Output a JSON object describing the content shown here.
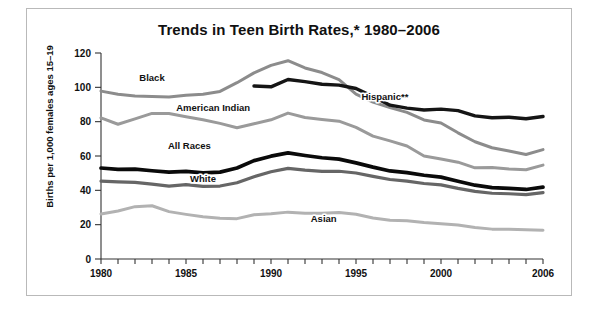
{
  "figure": {
    "title": "Trends in Teen Birth Rates,* 1980–2006",
    "ylabel": "Births per 1,000 females ages 15–19"
  },
  "chart_data": {
    "type": "line",
    "title": "Trends in Teen Birth Rates,* 1980–2006",
    "xlabel": "",
    "ylabel": "Births per 1,000 females ages 15–19",
    "xlim": [
      1980,
      2006
    ],
    "ylim": [
      0,
      120
    ],
    "yticks": [
      0,
      20,
      40,
      60,
      80,
      100,
      120
    ],
    "ytick_labels": [
      "0",
      "20",
      "40",
      "60",
      "80",
      "100",
      "120"
    ],
    "xticks": [
      1980,
      1981,
      1982,
      1983,
      1984,
      1985,
      1986,
      1987,
      1988,
      1989,
      1990,
      1991,
      1992,
      1993,
      1994,
      1995,
      1996,
      1997,
      1998,
      1999,
      2000,
      2001,
      2002,
      2003,
      2004,
      2005,
      2006
    ],
    "xtick_labels_shown": [
      "1980",
      "1985",
      "1990",
      "1995",
      "2000",
      "2006"
    ],
    "grid": false,
    "legend_position": "inline-labels",
    "series": [
      {
        "name": "Black",
        "color": "#8c8c8c",
        "width": 3.0,
        "label_x": 1983.0,
        "label_y": 103.5,
        "x": [
          1980,
          1981,
          1982,
          1983,
          1984,
          1985,
          1986,
          1987,
          1988,
          1989,
          1990,
          1991,
          1992,
          1993,
          1994,
          1995,
          1996,
          1997,
          1998,
          1999,
          2000,
          2001,
          2002,
          2003,
          2004,
          2005,
          2006
        ],
        "values": [
          97.8,
          96.0,
          95.0,
          94.7,
          94.4,
          95.4,
          96.0,
          97.6,
          102.7,
          108.4,
          112.8,
          115.5,
          111.3,
          108.6,
          104.5,
          96.1,
          91.4,
          88.2,
          85.4,
          81.0,
          79.2,
          73.5,
          68.3,
          64.8,
          62.9,
          60.9,
          63.7
        ]
      },
      {
        "name": "Hispanic**",
        "color": "#151515",
        "width": 3.4,
        "label_x": 1996.7,
        "label_y": 92.5,
        "x": [
          1989,
          1990,
          1991,
          1992,
          1993,
          1994,
          1995,
          1996,
          1997,
          1998,
          1999,
          2000,
          2001,
          2002,
          2003,
          2004,
          2005,
          2006
        ],
        "values": [
          100.8,
          100.3,
          104.6,
          103.3,
          101.8,
          101.3,
          99.3,
          94.6,
          89.6,
          87.9,
          86.8,
          87.3,
          86.4,
          83.4,
          82.3,
          82.6,
          81.7,
          83.0
        ]
      },
      {
        "name": "American Indian",
        "color": "#9a9a9a",
        "width": 3.0,
        "label_x": 1986.6,
        "label_y": 86.5,
        "x": [
          1980,
          1981,
          1982,
          1983,
          1984,
          1985,
          1986,
          1987,
          1988,
          1989,
          1990,
          1991,
          1992,
          1993,
          1994,
          1995,
          1996,
          1997,
          1998,
          1999,
          2000,
          2001,
          2002,
          2003,
          2004,
          2005,
          2006
        ],
        "values": [
          82.2,
          78.5,
          81.6,
          84.8,
          84.7,
          82.9,
          81.1,
          79.0,
          76.5,
          78.8,
          81.1,
          85.0,
          82.4,
          81.3,
          80.3,
          76.7,
          71.6,
          68.8,
          65.8,
          60.0,
          58.3,
          56.4,
          53.1,
          53.3,
          52.5,
          52.0,
          54.7
        ]
      },
      {
        "name": "All Races",
        "color": "#0a0a0a",
        "width": 3.7,
        "label_x": 1985.2,
        "label_y": 64.0,
        "x": [
          1980,
          1981,
          1982,
          1983,
          1984,
          1985,
          1986,
          1987,
          1988,
          1989,
          1990,
          1991,
          1992,
          1993,
          1994,
          1995,
          1996,
          1997,
          1998,
          1999,
          2000,
          2001,
          2002,
          2003,
          2004,
          2005,
          2006
        ],
        "values": [
          53.0,
          52.2,
          52.4,
          51.4,
          50.6,
          51.0,
          50.2,
          50.6,
          53.0,
          57.3,
          59.9,
          61.8,
          60.3,
          59.0,
          58.2,
          56.0,
          53.5,
          51.3,
          50.3,
          48.8,
          47.7,
          45.3,
          43.0,
          41.6,
          41.1,
          40.5,
          41.9
        ]
      },
      {
        "name": "White",
        "color": "#666666",
        "width": 3.2,
        "label_x": 1986.0,
        "label_y": 45.0,
        "x": [
          1980,
          1981,
          1982,
          1983,
          1984,
          1985,
          1986,
          1987,
          1988,
          1989,
          1990,
          1991,
          1992,
          1993,
          1994,
          1995,
          1996,
          1997,
          1998,
          1999,
          2000,
          2001,
          2002,
          2003,
          2004,
          2005,
          2006
        ],
        "values": [
          45.4,
          44.9,
          44.6,
          43.6,
          42.5,
          43.3,
          42.3,
          42.5,
          44.4,
          47.9,
          50.8,
          52.8,
          51.8,
          51.1,
          51.1,
          50.1,
          48.1,
          46.3,
          45.4,
          44.0,
          43.2,
          41.1,
          39.4,
          38.3,
          38.0,
          37.5,
          38.7
        ]
      },
      {
        "name": "Asian",
        "color": "#b2b2b2",
        "width": 3.0,
        "label_x": 1993.1,
        "label_y": 21.5,
        "x": [
          1980,
          1981,
          1982,
          1983,
          1984,
          1985,
          1986,
          1987,
          1988,
          1989,
          1990,
          1991,
          1992,
          1993,
          1994,
          1995,
          1996,
          1997,
          1998,
          1999,
          2000,
          2001,
          2002,
          2003,
          2004,
          2005,
          2006
        ],
        "values": [
          26.2,
          28.0,
          30.5,
          31.0,
          27.6,
          26.0,
          24.6,
          23.8,
          23.5,
          25.8,
          26.4,
          27.3,
          26.6,
          26.6,
          27.1,
          26.1,
          23.9,
          22.6,
          22.3,
          21.2,
          20.5,
          19.8,
          18.3,
          17.4,
          17.3,
          17.0,
          16.7
        ]
      }
    ],
    "footnote_markers": [
      "*",
      "**"
    ]
  }
}
